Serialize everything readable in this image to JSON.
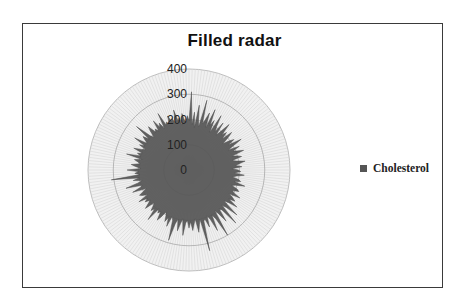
{
  "chart_data": {
    "type": "radar",
    "title": "Filled radar",
    "legend": {
      "position": "right",
      "entries": [
        "Cholesterol"
      ]
    },
    "axis": {
      "min": 0,
      "max": 400,
      "ticks": [
        "0",
        "100",
        "200",
        "300",
        "400"
      ],
      "grid": true
    },
    "series": [
      {
        "name": "Cholesterol",
        "color": "#555555",
        "values": [
          195,
          310,
          180,
          230,
          170,
          260,
          200,
          175,
          285,
          190,
          210,
          240,
          180,
          260,
          195,
          220,
          170,
          250,
          205,
          185,
          230,
          175,
          200,
          240,
          190,
          210,
          180,
          225,
          200,
          170,
          195,
          215,
          185,
          240,
          200,
          175,
          220,
          190,
          205,
          230,
          180,
          200,
          215,
          175,
          190,
          225,
          200,
          185,
          210,
          170,
          195,
          205,
          180,
          220,
          190,
          175,
          200,
          210,
          185,
          230,
          195,
          180,
          205,
          215,
          190,
          200,
          230,
          185,
          205,
          220,
          195,
          240,
          200,
          185,
          260,
          210,
          190,
          280,
          205,
          195,
          250,
          210,
          190,
          300,
          220,
          200,
          265,
          215,
          195,
          240,
          205,
          210,
          330,
          200,
          220,
          250,
          195,
          215,
          240,
          205,
          230,
          200,
          210,
          260,
          195,
          215,
          245,
          200,
          220,
          290,
          210,
          195,
          240,
          205,
          225,
          200,
          190,
          215,
          235,
          200,
          210,
          195,
          255,
          205,
          220,
          200,
          190,
          230,
          210,
          195,
          215,
          200,
          235,
          190,
          210,
          220,
          200,
          185,
          240,
          205,
          195,
          260,
          210,
          190,
          225,
          200,
          310,
          195,
          215,
          200,
          245,
          190,
          210,
          230,
          195,
          205,
          220,
          190,
          255,
          200,
          215,
          195,
          235,
          205,
          190,
          220,
          200,
          250,
          195,
          210,
          225,
          200,
          270,
          205,
          190,
          215,
          235,
          200,
          210,
          195,
          240,
          205,
          220,
          190,
          255,
          200,
          210,
          195,
          230,
          205,
          215,
          190,
          245,
          200,
          210,
          180,
          225,
          200,
          190,
          215
        ]
      }
    ]
  },
  "legend_label": "Cholesterol"
}
